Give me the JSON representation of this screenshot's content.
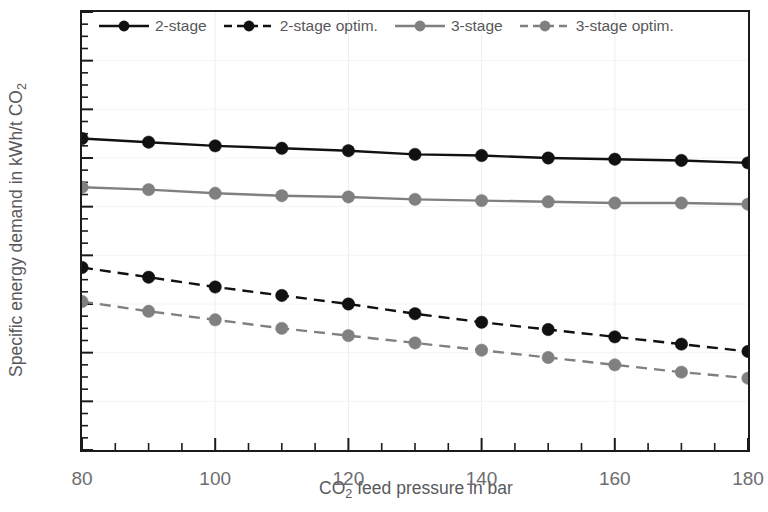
{
  "chart_data": {
    "type": "line",
    "title": "",
    "xlabel": "CO2 feed pressure in bar",
    "xlabel_parts": {
      "pre": "CO",
      "sub": "2",
      "post": " feed pressure in bar"
    },
    "ylabel": "Specific energy demand in kWh/t CO2",
    "ylabel_parts": {
      "pre": "Specific energy demand in kWh/t CO",
      "sub": "2",
      "post": ""
    },
    "x": [
      80,
      90,
      100,
      110,
      120,
      130,
      140,
      150,
      160,
      170,
      180
    ],
    "xlim": [
      80,
      180
    ],
    "ylim": [
      2,
      20
    ],
    "xticks": [
      80,
      100,
      120,
      140,
      160,
      180
    ],
    "xtick_labels": [
      "80",
      "100",
      "120",
      "140",
      "160",
      "180"
    ],
    "x_minor_tick_step": 5,
    "yticks": [
      2,
      4,
      6,
      8,
      10,
      12,
      14,
      16,
      18,
      20
    ],
    "ytick_labels": [
      "2",
      "4",
      "6",
      "8",
      "10",
      "12",
      "14",
      "16",
      "18",
      "20"
    ],
    "y_minor_tick_step": 0.5,
    "grid": "faint-vertical",
    "legend_position": "top-inside",
    "series": [
      {
        "name": "2-stage",
        "color": "#111111",
        "style": "solid",
        "marker": "circle",
        "values": [
          14.8,
          14.65,
          14.5,
          14.4,
          14.3,
          14.15,
          14.1,
          14.0,
          13.95,
          13.9,
          13.8
        ]
      },
      {
        "name": "2-stage optim.",
        "color": "#111111",
        "style": "dashed",
        "marker": "circle",
        "values": [
          9.5,
          9.1,
          8.7,
          8.35,
          8.0,
          7.6,
          7.25,
          6.95,
          6.65,
          6.35,
          6.05
        ]
      },
      {
        "name": "3-stage",
        "color": "#808080",
        "style": "solid",
        "marker": "circle",
        "values": [
          12.8,
          12.7,
          12.55,
          12.45,
          12.4,
          12.3,
          12.25,
          12.2,
          12.15,
          12.15,
          12.1
        ]
      },
      {
        "name": "3-stage optim.",
        "color": "#808080",
        "style": "dashed",
        "marker": "circle",
        "values": [
          8.1,
          7.7,
          7.35,
          7.0,
          6.7,
          6.4,
          6.1,
          5.8,
          5.5,
          5.2,
          4.95
        ]
      }
    ]
  },
  "legend": {
    "entries": [
      {
        "label": "2-stage"
      },
      {
        "label": "2-stage optim."
      },
      {
        "label": "3-stage"
      },
      {
        "label": "3-stage optim."
      }
    ]
  },
  "colors": {
    "axis": "#1b1b1b",
    "text": "#59595b",
    "series_dark": "#111111",
    "series_gray": "#808080",
    "background": "#ffffff"
  }
}
